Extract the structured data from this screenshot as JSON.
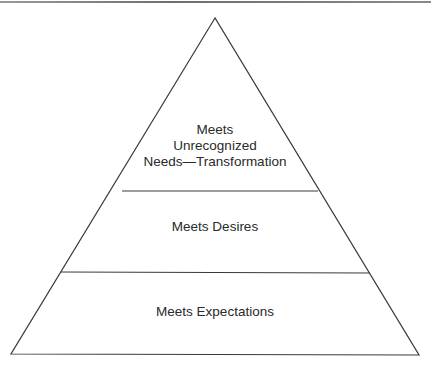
{
  "diagram": {
    "type": "pyramid",
    "stroke_color": "#3a3a3a",
    "levels": [
      {
        "lines": [
          "Meets",
          "Unrecognized",
          "Needs—Transformation"
        ]
      },
      {
        "lines": [
          "Meets Desires"
        ]
      },
      {
        "lines": [
          "Meets Expectations"
        ]
      }
    ]
  }
}
